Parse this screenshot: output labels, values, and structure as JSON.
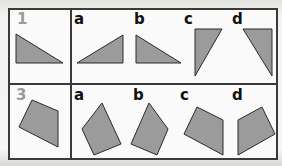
{
  "exercise": {
    "rows": [
      {
        "number_label": "1",
        "shape_type": "triangle",
        "reference_shape": {
          "points": "16,34 16,63 63,63"
        },
        "options": [
          {
            "label": "a",
            "points": "77,63 123,35 123,63"
          },
          {
            "label": "b",
            "points": "136,35 136,63 181,63"
          },
          {
            "label": "c",
            "points": "195,29 222,29 195,76"
          },
          {
            "label": "d",
            "points": "243,29 272,29 272,76"
          }
        ]
      },
      {
        "number_label": "3",
        "shape_type": "quadrilateral",
        "reference_shape": {
          "points": "32,100 58,111 58,147 19,127"
        },
        "options": [
          {
            "label": "a",
            "points": "102,103 121,144 94,155 82,129"
          },
          {
            "label": "b",
            "points": "149,103 168,129 157,155 131,144"
          },
          {
            "label": "c",
            "points": "197,107 223,120 223,155 184,134"
          },
          {
            "label": "d",
            "points": "262,107 275,134 238,155 238,120"
          }
        ]
      }
    ]
  },
  "colors": {
    "shape_fill": "#9b9b9b",
    "shape_stroke": "#2a2a2a",
    "grid_line": "#3a3a3a",
    "number_label": "#9a9a9a",
    "option_label": "#111111",
    "cell_background": "#fafafa"
  }
}
